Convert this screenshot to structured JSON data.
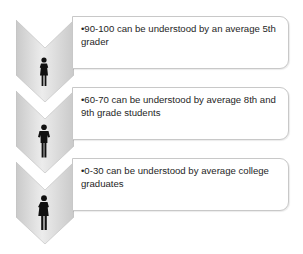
{
  "diagram": {
    "items": [
      {
        "text": "•90-100 can be understood by an average 5th grader",
        "icon": "woman-icon"
      },
      {
        "text": "•60-70 can be understood by average 8th and 9th grade students",
        "icon": "man-icon"
      },
      {
        "text": "•0-30 can be understood by average college graduates",
        "icon": "woman-icon"
      }
    ],
    "colors": {
      "chevron_light": "#ececec",
      "chevron_dark": "#c4c4c4",
      "box_border": "#c8c8c8",
      "text": "#262626"
    }
  }
}
